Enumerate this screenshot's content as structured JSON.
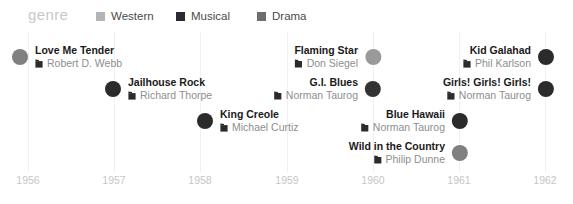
{
  "legend": {
    "title": "genre",
    "items": [
      {
        "label": "Western",
        "color": "#b4b4b4",
        "swatch_icon": "square-swatch-icon"
      },
      {
        "label": "Musical",
        "color": "#2b2b2b",
        "swatch_icon": "square-swatch-icon"
      },
      {
        "label": "Drama",
        "color": "#6e6e6e",
        "swatch_icon": "square-swatch-icon"
      }
    ]
  },
  "axis": {
    "ticks": [
      "1956",
      "1957",
      "1958",
      "1959",
      "1960",
      "1961",
      "1962"
    ]
  },
  "events": [
    {
      "title": "Love Me Tender",
      "director": "Robert D. Webb",
      "genre": "Drama",
      "color": "#808080",
      "director_icon": "clapperboard-icon"
    },
    {
      "title": "Jailhouse Rock",
      "director": "Richard Thorpe",
      "genre": "Musical",
      "color": "#2b2b2b",
      "director_icon": "clapperboard-icon"
    },
    {
      "title": "King Creole",
      "director": "Michael Curtiz",
      "genre": "Musical",
      "color": "#2b2b2b",
      "director_icon": "clapperboard-icon"
    },
    {
      "title": "Flaming Star",
      "director": "Don Siegel",
      "genre": "Drama",
      "color": "#9a9a9a",
      "director_icon": "clapperboard-icon"
    },
    {
      "title": "G.I. Blues",
      "director": "Norman Taurog",
      "genre": "Musical",
      "color": "#333333",
      "director_icon": "clapperboard-icon"
    },
    {
      "title": "Blue Hawaii",
      "director": "Norman Taurog",
      "genre": "Musical",
      "color": "#2b2b2b",
      "director_icon": "clapperboard-icon"
    },
    {
      "title": "Wild in the Country",
      "director": "Philip Dunne",
      "genre": "Drama",
      "color": "#808080",
      "director_icon": "clapperboard-icon"
    },
    {
      "title": "Kid Galahad",
      "director": "Phil Karlson",
      "genre": "Musical",
      "color": "#2b2b2b",
      "director_icon": "clapperboard-icon"
    },
    {
      "title": "Girls! Girls! Girls!",
      "director": "Norman Taurog",
      "genre": "Musical",
      "color": "#2b2b2b",
      "director_icon": "clapperboard-icon"
    }
  ]
}
